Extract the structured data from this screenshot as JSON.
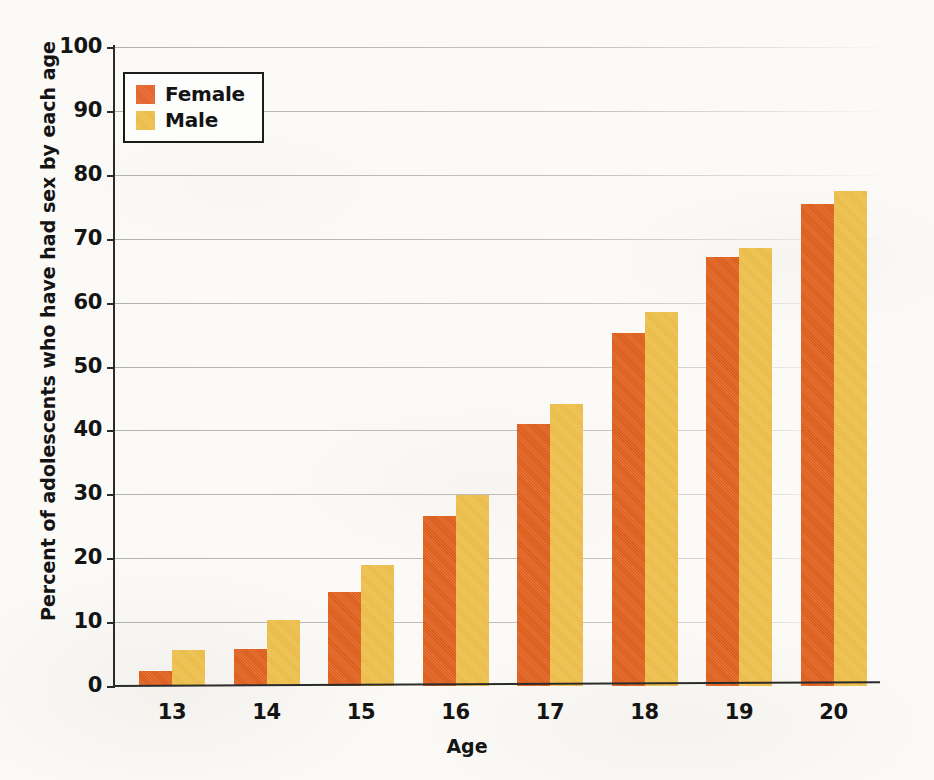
{
  "chart_data": {
    "type": "bar",
    "title": "",
    "xlabel": "Age",
    "ylabel": "Percent of adolescents who have had sex by each age",
    "categories": [
      "13",
      "14",
      "15",
      "16",
      "17",
      "18",
      "19",
      "20"
    ],
    "series": [
      {
        "name": "Female",
        "color": "#e1601d",
        "values": [
          2.3,
          5.8,
          14.7,
          26.6,
          41.0,
          55.2,
          67.1,
          75.5
        ]
      },
      {
        "name": "Male",
        "color": "#efc049",
        "values": [
          5.7,
          10.4,
          19.0,
          29.9,
          44.1,
          58.5,
          68.5,
          77.5
        ]
      }
    ],
    "ylim": [
      0,
      100
    ],
    "yticks": [
      "0",
      "10",
      "20",
      "30",
      "40",
      "50",
      "60",
      "70",
      "80",
      "90",
      "100"
    ],
    "grid": true,
    "legend_position": "top-left"
  },
  "legend": {
    "items": [
      {
        "label": "Female"
      },
      {
        "label": "Male"
      }
    ]
  }
}
